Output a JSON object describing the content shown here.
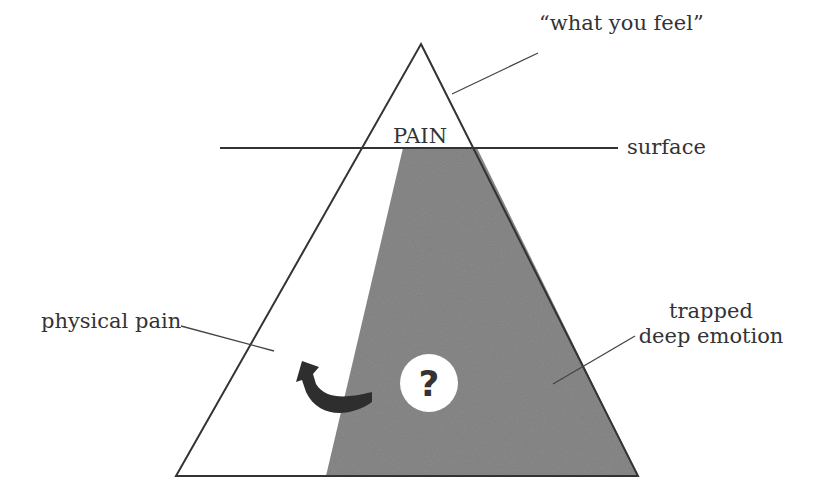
{
  "diagram": {
    "type": "iceberg-triangle",
    "labels": {
      "top": "“what you feel”",
      "apex": "PAIN",
      "surface": "surface",
      "left": "physical pain",
      "right_line1": "trapped",
      "right_line2": "deep emotion",
      "center_symbol": "?"
    },
    "colors": {
      "outline": "#333333",
      "shaded_region": "#8a8a8a",
      "arrow": "#2e2e2e",
      "circle_fill": "#ffffff",
      "background": "#ffffff"
    },
    "regions": [
      {
        "name": "above-surface",
        "label": "PAIN"
      },
      {
        "name": "physical-pain-region",
        "label": "physical pain"
      },
      {
        "name": "trapped-emotion-region",
        "label": "trapped deep emotion"
      }
    ],
    "arrow": {
      "direction": "from trapped deep emotion toward physical pain"
    }
  }
}
